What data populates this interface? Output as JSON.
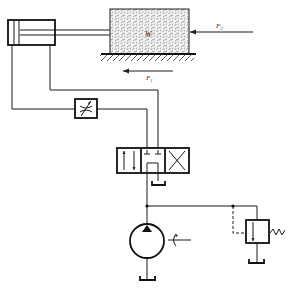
{
  "diagram": {
    "type": "hydraulic-circuit",
    "components": [
      {
        "id": "cylinder",
        "kind": "double-acting cylinder"
      },
      {
        "id": "load",
        "kind": "mass block",
        "label": "W"
      },
      {
        "id": "ground",
        "kind": "hatched ground surface"
      },
      {
        "id": "flow_control",
        "kind": "variable throttle valve"
      },
      {
        "id": "directional_valve",
        "kind": "4/3 directional control valve, tandem center"
      },
      {
        "id": "pump",
        "kind": "variable displacement pump with drive shaft"
      },
      {
        "id": "relief_valve",
        "kind": "pressure relief valve with spring"
      },
      {
        "id": "tank_valve",
        "kind": "tank return"
      },
      {
        "id": "tank_pump",
        "kind": "tank return"
      },
      {
        "id": "tank_relief",
        "kind": "tank return"
      }
    ],
    "labels": {
      "load": "W",
      "external_force": "F",
      "external_force_sub": "2",
      "friction_force": "F",
      "friction_force_sub": "1"
    }
  }
}
